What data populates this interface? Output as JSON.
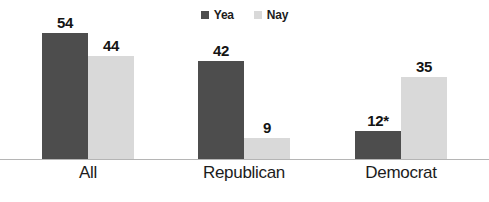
{
  "chart_data": {
    "type": "bar",
    "title": "",
    "xlabel": "",
    "ylabel": "",
    "grid": false,
    "legend_position": "top-center",
    "axis_visible": false,
    "baseline_only": true,
    "ylim": [
      0,
      56
    ],
    "categories": [
      "All",
      "Republican",
      "Democrat"
    ],
    "series": [
      {
        "name": "Yea",
        "color": "#4d4d4d",
        "values": [
          54,
          42,
          12
        ],
        "labels": [
          "54",
          "42",
          "12*"
        ]
      },
      {
        "name": "Nay",
        "color": "#d9d9d9",
        "values": [
          44,
          9,
          35
        ],
        "labels": [
          "44",
          "9",
          "35"
        ]
      }
    ],
    "annotations": [
      "* value marked with asterisk"
    ]
  },
  "legend": {
    "items": [
      {
        "label": "Yea",
        "color": "#4d4d4d"
      },
      {
        "label": "Nay",
        "color": "#d9d9d9"
      }
    ]
  },
  "axis": {
    "categories": [
      {
        "label": "All"
      },
      {
        "label": "Republican"
      },
      {
        "label": "Democrat"
      }
    ],
    "baseline_color": "#b5b5b5"
  },
  "bars": {
    "all": {
      "yea": {
        "label": "54",
        "value": 54
      },
      "nay": {
        "label": "44",
        "value": 44
      }
    },
    "republican": {
      "yea": {
        "label": "42",
        "value": 42
      },
      "nay": {
        "label": "9",
        "value": 9
      }
    },
    "democrat": {
      "yea": {
        "label": "12*",
        "value": 12
      },
      "nay": {
        "label": "35",
        "value": 35
      }
    }
  },
  "title_sliver": {
    "text": ""
  }
}
